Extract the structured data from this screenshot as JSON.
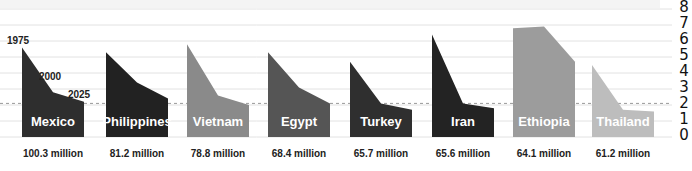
{
  "chart_data": {
    "type": "area",
    "title": "",
    "xlabel": "",
    "ylabel": "",
    "ylim": [
      0,
      8
    ],
    "y_ticks": [
      "0",
      "1",
      "2",
      "3",
      "4",
      "5",
      "6",
      "7",
      "8"
    ],
    "grid": true,
    "reference_line": {
      "value": 2.1,
      "style": "dashed"
    },
    "x": [
      "1975",
      "2000",
      "2025"
    ],
    "year_annotations": [
      "1975",
      "2000",
      "2025"
    ],
    "series": [
      {
        "name": "Mexico",
        "population": "100.3 million",
        "values": [
          5.6,
          2.8,
          2.2
        ],
        "color": "#2e2e2e"
      },
      {
        "name": "Philippines",
        "population": "81.2 million",
        "values": [
          5.3,
          3.4,
          2.4
        ],
        "color": "#222222"
      },
      {
        "name": "Vietnam",
        "population": "78.8 million",
        "values": [
          5.8,
          2.6,
          2.0
        ],
        "color": "#8a8a8a"
      },
      {
        "name": "Egypt",
        "population": "68.4 million",
        "values": [
          5.3,
          3.1,
          2.1
        ],
        "color": "#555555"
      },
      {
        "name": "Turkey",
        "population": "65.7 million",
        "values": [
          4.7,
          2.1,
          1.7
        ],
        "color": "#2f2f2f"
      },
      {
        "name": "Iran",
        "population": "65.6 million",
        "values": [
          6.4,
          2.1,
          1.8
        ],
        "color": "#232323"
      },
      {
        "name": "Ethiopia",
        "population": "64.1 million",
        "values": [
          6.8,
          6.9,
          4.7
        ],
        "color": "#9c9c9c"
      },
      {
        "name": "Thailand",
        "population": "61.2 million",
        "values": [
          4.5,
          1.7,
          1.6
        ],
        "color": "#bdbdbd"
      }
    ]
  },
  "layout": {
    "panel_x": [
      22,
      106,
      187,
      268,
      350,
      432,
      513,
      592
    ],
    "panel_width": 62
  }
}
